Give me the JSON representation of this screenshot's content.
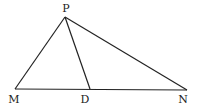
{
  "diagram": {
    "type": "triangle",
    "points": {
      "P": {
        "label": "P",
        "x": 65,
        "y": 17,
        "lx": 66,
        "ly": 12
      },
      "M": {
        "label": "M",
        "x": 15,
        "y": 89,
        "lx": 14,
        "ly": 103
      },
      "D": {
        "label": "D",
        "x": 90,
        "y": 89,
        "lx": 85,
        "ly": 103
      },
      "N": {
        "label": "N",
        "x": 187,
        "y": 90,
        "lx": 183,
        "ly": 103
      }
    },
    "segments": [
      [
        "P",
        "M"
      ],
      [
        "P",
        "N"
      ],
      [
        "P",
        "D"
      ],
      [
        "M",
        "N"
      ]
    ]
  }
}
